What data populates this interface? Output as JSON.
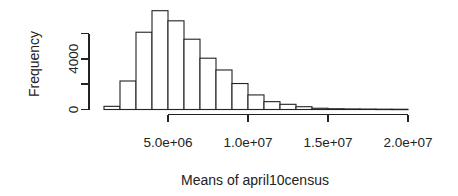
{
  "chart_data": {
    "type": "histogram",
    "title": "",
    "xlabel": "Means of april10census",
    "ylabel": "Frequency",
    "bins": {
      "start": 1000000,
      "width": 1000000,
      "frequencies": [
        250,
        2250,
        6100,
        7800,
        7000,
        5550,
        4050,
        3120,
        2050,
        1150,
        620,
        410,
        220,
        100,
        60,
        45,
        35,
        25,
        20
      ]
    },
    "x_ticks": [
      {
        "value": 5000000,
        "label": "5.0e+06"
      },
      {
        "value": 10000000,
        "label": "1.0e+07"
      },
      {
        "value": 15000000,
        "label": "1.5e+07"
      },
      {
        "value": 20000000,
        "label": "2.0e+07"
      }
    ],
    "y_ticks": [
      {
        "value": 0,
        "label": "0"
      },
      {
        "value": 2000,
        "label": ""
      },
      {
        "value": 4000,
        "label": "4000"
      },
      {
        "value": 6000,
        "label": ""
      }
    ],
    "x_range": [
      1000000,
      20000000
    ],
    "y_range": [
      0,
      7800
    ],
    "grid": "off",
    "legend": "none",
    "bar_fill": "#ffffff",
    "line_color": "#222222",
    "background": "#ffffff"
  }
}
